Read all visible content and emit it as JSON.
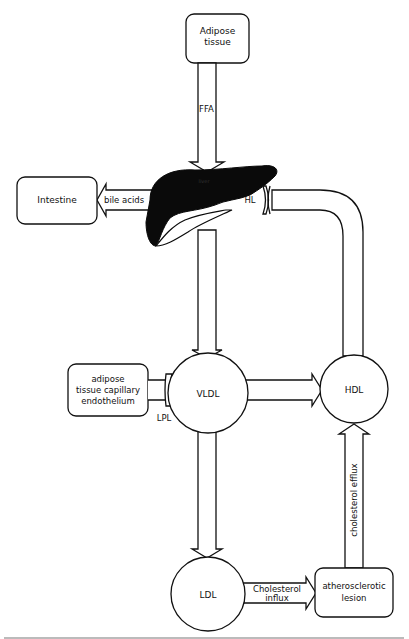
{
  "nodes": {
    "adipose_tissue": {
      "line1": "Adipose",
      "line2": "tissue"
    },
    "intestine": {
      "label": "Intestine"
    },
    "liver": {
      "label": "liver"
    },
    "adipose_capillary": {
      "line1": "adipose",
      "line2": "tissue capillary",
      "line3": "endothelium"
    },
    "vldl": {
      "label": "VLDL"
    },
    "hdl": {
      "label": "HDL"
    },
    "ldl": {
      "label": "LDL"
    },
    "lesion": {
      "line1": "atherosclerotic",
      "line2": "lesion"
    }
  },
  "edges": {
    "ffa": {
      "label": "FFA"
    },
    "bile_acids": {
      "label": "bile acids"
    },
    "hl": {
      "label": "HL"
    },
    "lpl": {
      "label": "LPL"
    },
    "cholesterol_influx": {
      "line1": "Cholesterol",
      "line2": "influx"
    },
    "cholesterol_efflux": {
      "label": "cholesterol efflux"
    }
  },
  "colors": {
    "ink": "#111111",
    "background": "#ffffff"
  }
}
